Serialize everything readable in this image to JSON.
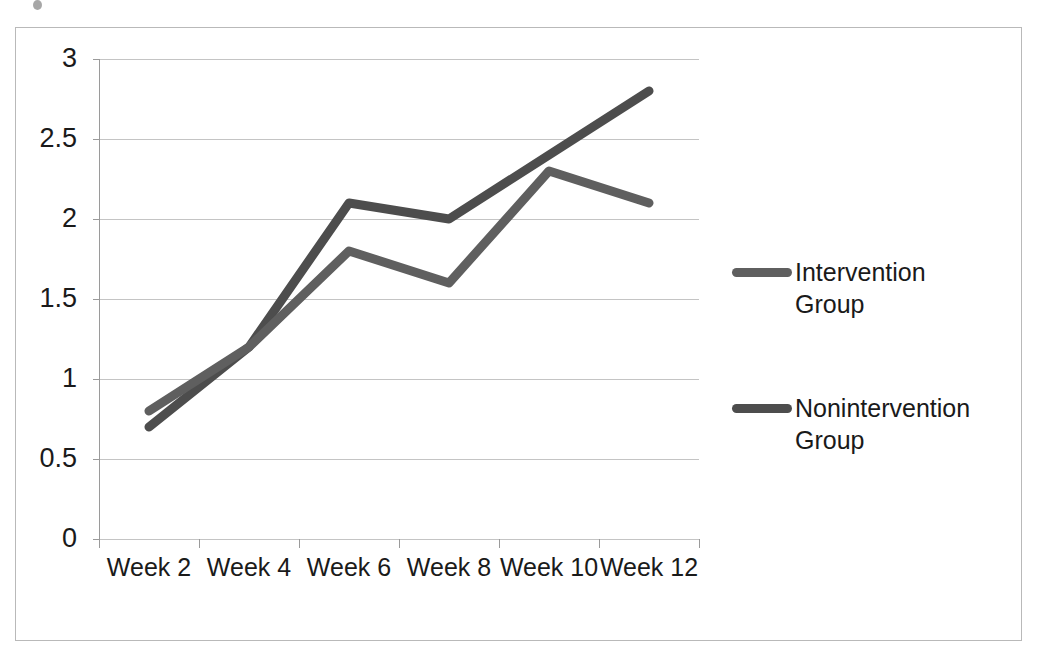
{
  "chart_data": {
    "type": "line",
    "title": "",
    "xlabel": "",
    "ylabel": "",
    "categories": [
      "Week 2",
      "Week 4",
      "Week 6",
      "Week 8",
      "Week 10",
      "Week 12"
    ],
    "series": [
      {
        "name": "Intervention Group",
        "color": "#5f5f5f",
        "values": [
          0.8,
          1.2,
          1.8,
          1.6,
          2.3,
          2.1
        ]
      },
      {
        "name": "Nonintervention Group",
        "color": "#4d4d4d",
        "values": [
          0.7,
          1.2,
          2.1,
          2.0,
          2.4,
          2.8
        ]
      }
    ],
    "ylim": [
      0,
      3
    ],
    "ytick_values": [
      3,
      2.5,
      2,
      1.5,
      1,
      0.5,
      0
    ],
    "ytick_labels": [
      "3",
      "2.5",
      "2",
      "1.5",
      "1",
      "0.5",
      "0"
    ],
    "grid": true,
    "grid_axis": "y",
    "legend_position": "right"
  },
  "legend": {
    "entries": [
      {
        "label": "Intervention Group"
      },
      {
        "label": "Nonintervention Group"
      }
    ]
  },
  "colors": {
    "intervention": "#5f5f5f",
    "nonintervention": "#4d4d4d",
    "gridline": "#c4c4c4",
    "axis": "#9a9a9a",
    "frame_border": "#b9b9b9",
    "text": "#1a1a1a",
    "background": "#ffffff"
  }
}
